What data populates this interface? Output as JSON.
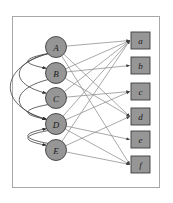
{
  "figure": {
    "frame": {
      "border_color": "#a8a8a8",
      "background": "#ffffff"
    },
    "colors": {
      "node_fill": "#969696",
      "node_stroke": "#3d3d3d",
      "edge_color": "#8c8c8c",
      "arc_color": "#4a4a4a",
      "label_color": "#1a1a1a"
    }
  },
  "left_nodes": [
    {
      "id": "A",
      "label": "A",
      "shape": "circle",
      "cx": 56,
      "cy": 47,
      "r": 10.5
    },
    {
      "id": "B",
      "label": "B",
      "shape": "circle",
      "cx": 56,
      "cy": 73,
      "r": 10.5
    },
    {
      "id": "C",
      "label": "C",
      "shape": "circle",
      "cx": 56,
      "cy": 98,
      "r": 10.5
    },
    {
      "id": "D",
      "label": "D",
      "shape": "circle",
      "cx": 56,
      "cy": 124,
      "r": 10.5
    },
    {
      "id": "E",
      "label": "E",
      "shape": "circle",
      "cx": 56,
      "cy": 150,
      "r": 10.5
    }
  ],
  "right_nodes": [
    {
      "id": "a",
      "label": "a",
      "shape": "square",
      "x": 131,
      "y": 32,
      "w": 19,
      "h": 17
    },
    {
      "id": "b",
      "label": "b",
      "shape": "square",
      "x": 131,
      "y": 57,
      "w": 19,
      "h": 17
    },
    {
      "id": "c",
      "label": "c",
      "shape": "square",
      "x": 131,
      "y": 83,
      "w": 19,
      "h": 17
    },
    {
      "id": "d",
      "label": "d",
      "shape": "square",
      "x": 131,
      "y": 108,
      "w": 19,
      "h": 17
    },
    {
      "id": "e",
      "label": "e",
      "shape": "square",
      "x": 131,
      "y": 131,
      "w": 19,
      "h": 17
    },
    {
      "id": "f",
      "label": "f",
      "shape": "square",
      "x": 131,
      "y": 156,
      "w": 19,
      "h": 17
    }
  ],
  "edges": [
    {
      "from": "A",
      "to": "a"
    },
    {
      "from": "A",
      "to": "d"
    },
    {
      "from": "A",
      "to": "f"
    },
    {
      "from": "B",
      "to": "a"
    },
    {
      "from": "B",
      "to": "b"
    },
    {
      "from": "B",
      "to": "d"
    },
    {
      "from": "C",
      "to": "a"
    },
    {
      "from": "C",
      "to": "c"
    },
    {
      "from": "D",
      "to": "a"
    },
    {
      "from": "D",
      "to": "c"
    },
    {
      "from": "D",
      "to": "e"
    },
    {
      "from": "D",
      "to": "f"
    },
    {
      "from": "E",
      "to": "a"
    },
    {
      "from": "E",
      "to": "d"
    },
    {
      "from": "E",
      "to": "f"
    }
  ],
  "arcs": [
    {
      "from": "A",
      "to": "B"
    },
    {
      "from": "A",
      "to": "C"
    },
    {
      "from": "A",
      "to": "D"
    },
    {
      "from": "B",
      "to": "D"
    },
    {
      "from": "C",
      "to": "D"
    },
    {
      "from": "D",
      "to": "E"
    },
    {
      "from": "E",
      "to": "D"
    }
  ]
}
